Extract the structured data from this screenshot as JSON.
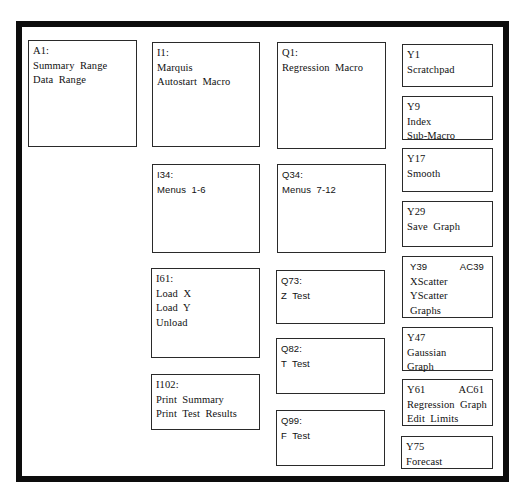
{
  "diagram": {
    "boxes": [
      {
        "id": "A1",
        "ref": "A1:",
        "lines": [
          "Summary  Range",
          "Data  Range"
        ]
      },
      {
        "id": "I1",
        "ref": "I1:",
        "lines": [
          "Marquis",
          "Autostart  Macro"
        ]
      },
      {
        "id": "Q1",
        "ref": "Q1:",
        "lines": [
          "Regression  Macro"
        ]
      },
      {
        "id": "Y1",
        "ref": "Y1",
        "lines": [
          "Scratchpad"
        ]
      },
      {
        "id": "Y9",
        "ref": "Y9",
        "lines": [
          "Index",
          "Sub-Macro"
        ]
      },
      {
        "id": "Y17",
        "ref": "Y17",
        "lines": [
          "Smooth"
        ]
      },
      {
        "id": "Y29",
        "ref": "Y29",
        "lines": [
          "Save  Graph"
        ]
      },
      {
        "id": "I34",
        "ref": "I34:",
        "lines": [
          "Menus  1-6"
        ]
      },
      {
        "id": "Q34",
        "ref": "Q34:",
        "lines": [
          "Menus  7-12"
        ]
      },
      {
        "id": "Y39",
        "ref": "Y39",
        "ref2": "AC39",
        "lines": [
          "XScatter",
          "YScatter",
          "Graphs"
        ]
      },
      {
        "id": "Y47",
        "ref": "Y47",
        "lines": [
          "Gaussian",
          "Graph"
        ]
      },
      {
        "id": "I61",
        "ref": "I61:",
        "lines": [
          "Load  X",
          "Load  Y",
          "Unload"
        ]
      },
      {
        "id": "Q73",
        "ref": "Q73:",
        "lines": [
          "Z  Test"
        ]
      },
      {
        "id": "Q82",
        "ref": "Q82:",
        "lines": [
          "T  Test"
        ]
      },
      {
        "id": "Y61",
        "ref": "Y61",
        "ref2": "AC61",
        "lines": [
          "Regression  Graph",
          "Edit  Limits"
        ]
      },
      {
        "id": "I102",
        "ref": "I102:",
        "lines": [
          "Print  Summary",
          "Print  Test  Results"
        ]
      },
      {
        "id": "Q99",
        "ref": "Q99:",
        "lines": [
          "F  Test"
        ]
      },
      {
        "id": "Y75",
        "ref": "Y75",
        "lines": [
          "Forecast"
        ]
      }
    ]
  },
  "colors": {
    "frame": "#0d0d0d",
    "box_border": "#2a2a2a",
    "text": "#111111",
    "background": "#ffffff"
  }
}
